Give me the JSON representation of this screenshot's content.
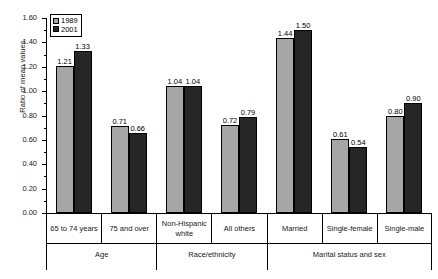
{
  "chart_data": {
    "type": "bar",
    "title": "",
    "subtitle": "",
    "xlabel": "",
    "ylabel": "Ratio of mean values",
    "ylim": [
      0.0,
      1.6
    ],
    "ytick_labels": [
      "0.00",
      "0.20",
      "0.40",
      "0.60",
      "0.80",
      "1.00",
      "1.20",
      "1.40",
      "1.60"
    ],
    "ytick_values": [
      0.0,
      0.2,
      0.4,
      0.6,
      0.8,
      1.0,
      1.2,
      1.4,
      1.6
    ],
    "minor_ticks": true,
    "grid": false,
    "legend_position": "top-left",
    "categories": [
      "65 to 74 years",
      "75 and over",
      "Non-Hispanic white",
      "All others",
      "Married",
      "Single-female",
      "Single-male"
    ],
    "series": [
      {
        "name": "1989",
        "color": "#a6a6a6",
        "values": [
          1.21,
          0.71,
          1.04,
          0.72,
          1.44,
          0.61,
          0.8
        ]
      },
      {
        "name": "2001",
        "color": "#262626",
        "values": [
          1.33,
          0.66,
          1.04,
          0.79,
          1.5,
          0.54,
          0.9
        ]
      }
    ],
    "bar_labels": {
      "1989": [
        "1.21",
        "0.71",
        "1.04",
        "0.72",
        "1.44",
        "0.61",
        "0.80"
      ],
      "2001": [
        "1.33",
        "0.66",
        "1.04",
        "0.79",
        "1.50",
        "0.54",
        "0.90"
      ]
    },
    "groups": [
      {
        "label": "Age",
        "span": 2
      },
      {
        "label": "Race/ethnicity",
        "span": 2
      },
      {
        "label": "Marital status and sex",
        "span": 3
      }
    ]
  },
  "legend": {
    "items": [
      {
        "label": "1989",
        "swatch": "s1989"
      },
      {
        "label": "2001",
        "swatch": "s2001"
      }
    ]
  },
  "axis": {
    "y_title": "Ratio of mean values"
  },
  "category_labels": {
    "c0": "65 to 74 years",
    "c1": "75 and over",
    "c2": "Non-Hispanic white",
    "c3": "All others",
    "c4": "Married",
    "c5": "Single-female",
    "c6": "Single-male"
  },
  "group_labels": {
    "g0": "Age",
    "g1": "Race/ethnicity",
    "g2": "Marital status and sex"
  }
}
